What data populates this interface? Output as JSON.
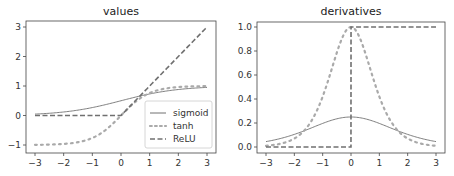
{
  "chart_data": [
    {
      "type": "line",
      "title": "values",
      "xlabel": "",
      "ylabel": "",
      "xlim": [
        -3.2,
        3.2
      ],
      "ylim": [
        -1.2,
        3.2
      ],
      "xticks": [
        "−3",
        "−2",
        "−1",
        "0",
        "1",
        "2",
        "3"
      ],
      "yticks": [
        "−1",
        "0",
        "1",
        "2",
        "3"
      ],
      "grid": false,
      "legend_position": "lower right",
      "x": [
        -3,
        -2,
        -1,
        0,
        1,
        2,
        3
      ],
      "series": [
        {
          "name": "sigmoid",
          "style": "solid",
          "values": [
            0.047,
            0.119,
            0.269,
            0.5,
            0.731,
            0.881,
            0.953
          ]
        },
        {
          "name": "tanh",
          "style": "dotted",
          "values": [
            -0.995,
            -0.964,
            -0.762,
            0.0,
            0.762,
            0.964,
            0.995
          ]
        },
        {
          "name": "ReLU",
          "style": "dashed",
          "values": [
            0,
            0,
            0,
            0,
            1,
            2,
            3
          ]
        }
      ]
    },
    {
      "type": "line",
      "title": "derivatives",
      "xlabel": "",
      "ylabel": "",
      "xlim": [
        -3.2,
        3.2
      ],
      "ylim": [
        -0.03,
        1.03
      ],
      "xticks": [
        "−3",
        "−2",
        "−1",
        "0",
        "1",
        "2",
        "3"
      ],
      "yticks": [
        "0.0",
        "0.2",
        "0.4",
        "0.6",
        "0.8",
        "1.0"
      ],
      "grid": false,
      "x": [
        -3,
        -2,
        -1,
        0,
        1,
        2,
        3
      ],
      "series": [
        {
          "name": "sigmoid",
          "style": "solid",
          "values": [
            0.045,
            0.105,
            0.197,
            0.25,
            0.197,
            0.105,
            0.045
          ]
        },
        {
          "name": "tanh",
          "style": "dotted",
          "values": [
            0.01,
            0.071,
            0.42,
            1.0,
            0.42,
            0.071,
            0.01
          ]
        },
        {
          "name": "ReLU",
          "style": "dashed",
          "values": [
            0,
            0,
            0,
            0,
            1,
            1,
            1
          ]
        }
      ]
    }
  ],
  "colors": {
    "line": "#707070",
    "axis": "#444444",
    "text": "#333333"
  }
}
